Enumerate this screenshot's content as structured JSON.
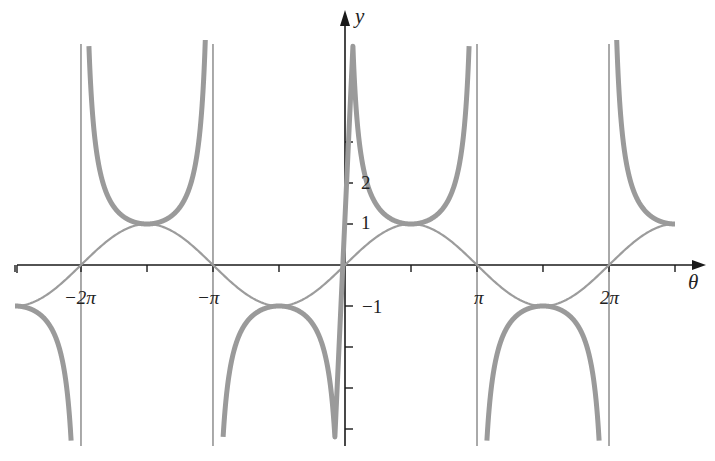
{
  "chart_data": {
    "type": "line",
    "title": "",
    "xlabel": "θ",
    "ylabel": "y",
    "x_range": [
      -8.16,
      8.1
    ],
    "ylim": [
      -4.25,
      5.5
    ],
    "grid": false,
    "legend": null,
    "x_ticks": [
      {
        "value": -6.2832,
        "label": "−2π"
      },
      {
        "value": -3.1416,
        "label": "−π"
      },
      {
        "value": 3.1416,
        "label": "π"
      },
      {
        "value": 6.2832,
        "label": "2π"
      }
    ],
    "x_minor_ticks": [
      -7.854,
      -4.712,
      -1.571,
      1.571,
      4.712,
      7.854
    ],
    "y_ticks": [
      {
        "value": 1,
        "label": "1"
      },
      {
        "value": 2,
        "label": "2"
      },
      {
        "value": 3,
        "label": ""
      },
      {
        "value": -1,
        "label": "−1"
      },
      {
        "value": -2,
        "label": ""
      },
      {
        "value": -3,
        "label": ""
      },
      {
        "value": -4,
        "label": ""
      }
    ],
    "asymptotes": [
      -6.2832,
      -3.1416,
      3.1416,
      6.2832
    ],
    "series": [
      {
        "name": "y = sin θ",
        "style": "thin",
        "color": "#9a9a9a",
        "x_start": -7.854,
        "x_end": 7.854
      },
      {
        "name": "y = csc θ",
        "style": "thick",
        "color": "#999999",
        "x_start": -7.854,
        "x_end": 7.854
      }
    ]
  },
  "labels": {
    "x_axis": "θ",
    "y_axis": "y",
    "neg_two_pi": "−2π",
    "neg_pi": "−π",
    "pi": "π",
    "two_pi": "2π",
    "y_1": "1",
    "y_2": "2",
    "y_neg1": "−1"
  }
}
